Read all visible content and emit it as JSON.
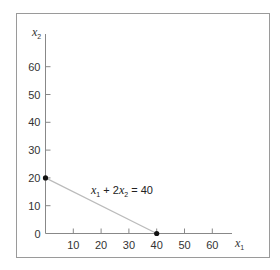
{
  "chart_data": {
    "type": "line",
    "title": "",
    "xlabel": "x1",
    "ylabel": "x2",
    "xlabel_display": {
      "base": "x",
      "sub": "1"
    },
    "ylabel_display": {
      "base": "x",
      "sub": "2"
    },
    "xlim": [
      0,
      70
    ],
    "ylim": [
      0,
      70
    ],
    "x_ticks": [
      10,
      20,
      30,
      40,
      50,
      60
    ],
    "y_ticks": [
      0,
      10,
      20,
      30,
      40,
      50,
      60
    ],
    "grid": false,
    "legend": null,
    "series": [
      {
        "name": "x1 + 2x2 = 40",
        "x": [
          0,
          40
        ],
        "y": [
          20,
          0
        ],
        "color": "#bbbbbb",
        "markers": [
          {
            "x": 0,
            "y": 20
          },
          {
            "x": 40,
            "y": 0
          }
        ],
        "marker_color": "#111111"
      }
    ],
    "annotations": [
      {
        "text": "x1 + 2x2 = 40",
        "x": 16,
        "y": 14.5
      }
    ]
  },
  "labels": {
    "equation": {
      "t1": "x",
      "s1": "1",
      "t2": " + 2",
      "t3": "x",
      "s2": "2",
      "t4": " = 40"
    }
  },
  "colors": {
    "frame": "#9a9a9a",
    "axis": "#888888",
    "line": "#bbbbbb",
    "point": "#111111",
    "text": "#333333"
  }
}
